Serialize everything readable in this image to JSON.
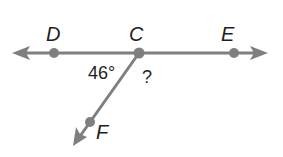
{
  "diagram": {
    "type": "geometry-angles",
    "line_color": "#7f7f7f",
    "point_color": "#7f7f7f",
    "points": {
      "D": {
        "label": "D"
      },
      "C": {
        "label": "C"
      },
      "E": {
        "label": "E"
      },
      "F": {
        "label": "F"
      }
    },
    "angles": {
      "DCF": {
        "label": "46°"
      },
      "FCE": {
        "label": "?"
      }
    }
  }
}
